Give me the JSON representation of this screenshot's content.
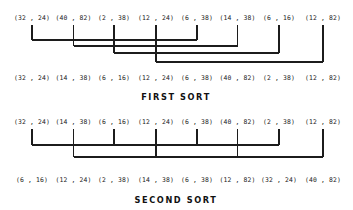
{
  "figure": {
    "type": "sorting-network-diagram",
    "columns": 8,
    "column_x": [
      32,
      73.5,
      114,
      156,
      197,
      237.5,
      279,
      323
    ],
    "ink_color": "#1c1c1c",
    "background_color": "#ffffff"
  },
  "first_sort": {
    "caption": "FIRST SORT",
    "caption_x": 176,
    "caption_y": 92,
    "input_row_y": 14,
    "output_row_y": 74,
    "inputs": [
      "(32 , 24)",
      "(40 , 82)",
      "(2 , 38)",
      "(12 , 24)",
      "(6 , 38)",
      "(14 , 38)",
      "(6 , 16)",
      "(12 , 82)"
    ],
    "outputs": [
      "(32 , 24)",
      "(14 , 38)",
      "(6 , 16)",
      "(12 , 24)",
      "(6 , 38)",
      "(40 , 82)",
      "(2 , 38)",
      "(12 , 82)"
    ],
    "connectors": [
      {
        "from_column": 1,
        "to_column": 5,
        "level_y": 40
      },
      {
        "from_column": 2,
        "to_column": 6,
        "level_y": 46
      },
      {
        "from_column": 3,
        "to_column": 7,
        "level_y": 53
      },
      {
        "from_column": 4,
        "to_column": 8,
        "level_y": 62
      }
    ],
    "tick_top_y": 25,
    "tick_bottom_y": 32
  },
  "second_sort": {
    "caption": "SECOND SORT",
    "caption_x": 176,
    "caption_y": 195,
    "input_row_y": 118,
    "output_row_y": 176,
    "inputs": [
      "(32 , 24)",
      "(14 , 38)",
      "(6 , 16)",
      "(12 , 24)",
      "(6 , 38)",
      "(40 , 82)",
      "(2 , 38)",
      "(12 , 82)"
    ],
    "outputs": [
      "(6 , 16)",
      "(12 , 24)",
      "(2 , 38)",
      "(14 , 38)",
      "(6 , 38)",
      "(12 , 82)",
      "(32 , 24)",
      "(40 , 82)"
    ],
    "connectors": [
      {
        "from_column": 1,
        "to_column": 7,
        "level_y": 145
      },
      {
        "from_column": 2,
        "to_column": 8,
        "level_y": 157
      }
    ],
    "drop_columns": [
      2,
      4,
      6,
      8
    ],
    "tick_top_y": 129,
    "tick_bottom_y": 136
  }
}
